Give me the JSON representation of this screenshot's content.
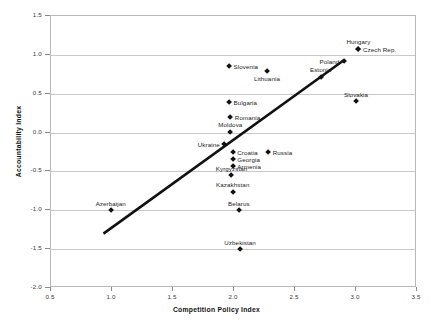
{
  "chart_data": {
    "type": "scatter",
    "title": "",
    "xlabel": "Competition Policy Index",
    "ylabel": "Accountability Index",
    "xlim": [
      0.5,
      3.5
    ],
    "ylim": [
      -2.0,
      1.5
    ],
    "xticks": [
      "0.5",
      "1.0",
      "1.5",
      "2.0",
      "2.5",
      "3.0",
      "3.5"
    ],
    "xtick_values": [
      0.5,
      1.0,
      1.5,
      2.0,
      2.5,
      3.0,
      3.5
    ],
    "yticks": [
      "1.5",
      "1.0",
      "0.5",
      "0.0",
      "-0.5",
      "-1.0",
      "-1.5",
      "-2.0"
    ],
    "ytick_values": [
      1.5,
      1.0,
      0.5,
      0.0,
      -0.5,
      -1.0,
      -1.5,
      -2.0
    ],
    "grid": "horizontal",
    "legend": "none",
    "marker_shape": "diamond",
    "marker_color": "#111111",
    "points": [
      {
        "name": "Hungary",
        "x": 3.02,
        "y": 1.08,
        "label_pos": "above"
      },
      {
        "name": "Czech Rep.",
        "x": 3.02,
        "y": 1.08,
        "label_pos": "right"
      },
      {
        "name": "Poland",
        "x": 2.9,
        "y": 0.92,
        "label_pos": "left"
      },
      {
        "name": "Estonia",
        "x": 2.71,
        "y": 0.72,
        "label_pos": "above"
      },
      {
        "name": "Slovenia",
        "x": 1.96,
        "y": 0.86,
        "label_pos": "right"
      },
      {
        "name": "Lithuania",
        "x": 2.27,
        "y": 0.79,
        "label_pos": "below"
      },
      {
        "name": "Slovakia",
        "x": 3.0,
        "y": 0.4,
        "label_pos": "above"
      },
      {
        "name": "Bulgaria",
        "x": 1.96,
        "y": 0.39,
        "label_pos": "right"
      },
      {
        "name": "Romania",
        "x": 1.97,
        "y": 0.2,
        "label_pos": "right"
      },
      {
        "name": "Moldova",
        "x": 1.97,
        "y": 0.01,
        "label_pos": "above"
      },
      {
        "name": "Ukraine",
        "x": 1.92,
        "y": -0.15,
        "label_pos": "left"
      },
      {
        "name": "Croatia",
        "x": 1.99,
        "y": -0.25,
        "label_pos": "right"
      },
      {
        "name": "Georgia",
        "x": 1.99,
        "y": -0.34,
        "label_pos": "right"
      },
      {
        "name": "Armenia",
        "x": 1.99,
        "y": -0.43,
        "label_pos": "right"
      },
      {
        "name": "Russia",
        "x": 2.28,
        "y": -0.25,
        "label_pos": "right"
      },
      {
        "name": "Kyrgyzstan",
        "x": 1.98,
        "y": -0.55,
        "label_pos": "above"
      },
      {
        "name": "Kazakhstan",
        "x": 1.99,
        "y": -0.76,
        "label_pos": "above"
      },
      {
        "name": "Azerbaijan",
        "x": 0.99,
        "y": -1.0,
        "label_pos": "above"
      },
      {
        "name": "Belarus",
        "x": 2.04,
        "y": -1.0,
        "label_pos": "above"
      },
      {
        "name": "Uzbekistan",
        "x": 2.05,
        "y": -1.5,
        "label_pos": "above"
      }
    ],
    "trendline": {
      "name": "linear-fit",
      "x0": 0.93,
      "y0": -1.3,
      "x1": 2.9,
      "y1": 0.93
    }
  }
}
